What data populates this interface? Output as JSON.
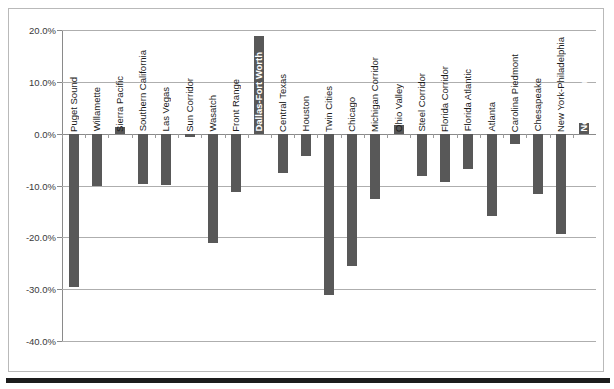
{
  "chart_data": {
    "type": "bar",
    "title": "",
    "subtitle": "",
    "xlabel": "",
    "ylabel": "",
    "ylim": [
      -40.0,
      20.0
    ],
    "y_tick_labels": [
      "20.0%",
      "10.0%",
      "0.0%",
      "-10.0%",
      "-20.0%",
      "-30.0%",
      "-40.0%"
    ],
    "y_tick_values": [
      20.0,
      10.0,
      0.0,
      -10.0,
      -20.0,
      -30.0,
      -40.0
    ],
    "grid": true,
    "legend": "none",
    "bar_color": "#585858",
    "gridline_color": "#aeaeae",
    "categories": [
      "Puget Sound",
      "Willamette",
      "Sierra Pacific",
      "Southern California",
      "Las Vegas",
      "Sun Corridor",
      "Wasatch",
      "Front Range",
      "Dallas-Fort Worth",
      "Central Texas",
      "Houston",
      "Twin Cities",
      "Chicago",
      "Michigan Corridor",
      "Ohio Valley",
      "Steel Corridor",
      "Florida Corridor",
      "Florida Atlantic",
      "Atlanta",
      "Carolina Piedmont",
      "Chesapeake",
      "New York-Philadelphia",
      "New England"
    ],
    "values": [
      -29.5,
      -10.1,
      1.3,
      -9.8,
      -9.9,
      -0.7,
      -21.0,
      -11.3,
      18.9,
      -7.5,
      -4.4,
      -31.2,
      -25.5,
      -12.7,
      1.6,
      -8.1,
      -9.4,
      -6.9,
      -15.9,
      -2.0,
      -11.7,
      -19.4,
      2.0
    ]
  }
}
